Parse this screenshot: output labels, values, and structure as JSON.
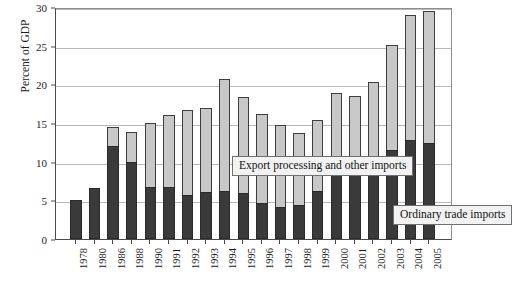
{
  "chart_data": {
    "type": "bar",
    "stacked": true,
    "title": "",
    "xlabel": "",
    "ylabel": "Percent of GDP",
    "ylim": [
      0,
      30
    ],
    "yticks": [
      0,
      5,
      10,
      15,
      20,
      25,
      30
    ],
    "ytick_labels": [
      "0",
      "5",
      "10",
      "15",
      "20",
      "25",
      "30"
    ],
    "grid": true,
    "legend_position": "inside-plot",
    "categories": [
      "1978",
      "1980",
      "1986",
      "1988",
      "1990",
      "1991",
      "1992",
      "1993",
      "1994",
      "1995",
      "1996",
      "1997",
      "1998",
      "1999",
      "2000",
      "2001",
      "2002",
      "2003",
      "2004",
      "2005"
    ],
    "series": [
      {
        "name": "Ordinary trade imports",
        "color": "#3a3a3a",
        "values": [
          5.1,
          6.6,
          12.0,
          10.0,
          6.7,
          6.7,
          5.7,
          6.1,
          6.2,
          5.9,
          4.7,
          4.1,
          4.4,
          6.2,
          8.6,
          8.6,
          8.9,
          11.5,
          12.8,
          12.4
        ]
      },
      {
        "name": "Export processing and other imports",
        "color": "#c8c8c8",
        "values": [
          0.0,
          0.0,
          2.5,
          3.8,
          8.3,
          9.4,
          11.0,
          10.9,
          14.5,
          12.4,
          11.5,
          10.6,
          9.3,
          9.2,
          10.3,
          9.9,
          11.4,
          13.6,
          16.2,
          17.1
        ]
      }
    ],
    "totals": [
      5.1,
      6.6,
      14.5,
      13.8,
      15.0,
      16.1,
      16.7,
      17.0,
      20.7,
      18.3,
      16.2,
      14.7,
      13.7,
      15.4,
      18.9,
      18.5,
      20.3,
      25.1,
      29.0,
      29.5
    ],
    "annotations": [
      {
        "name": "export-processing-label",
        "text": "Export processing and other imports"
      },
      {
        "name": "ordinary-trade-label",
        "text": "Ordinary trade imports"
      }
    ]
  },
  "axis": {
    "y_title": "Percent of GDP"
  },
  "legend": {
    "export_label": "Export processing and other imports",
    "ordinary_label": "Ordinary trade imports"
  },
  "footnote": {
    "text": ""
  }
}
